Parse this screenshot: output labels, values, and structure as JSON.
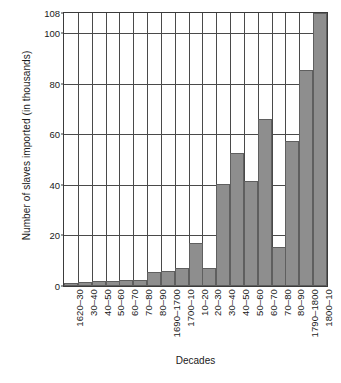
{
  "chart_data": {
    "type": "bar",
    "title": "",
    "xlabel": "Decades",
    "ylabel": "Number of slaves imported (in thousands)",
    "categories": [
      "1620–30",
      "30–40",
      "40–50",
      "50–60",
      "60–70",
      "70–80",
      "80–90",
      "1690–1700",
      "1700–10",
      "10–20",
      "20–30",
      "30–40",
      "40–50",
      "50–60",
      "60–70",
      "70–80",
      "80–90",
      "1790–1800",
      "1800–10"
    ],
    "values": [
      1,
      1.5,
      1.8,
      2,
      2.5,
      2.5,
      5.5,
      5.8,
      7,
      17,
      7,
      40.5,
      52.5,
      41.5,
      66,
      15.5,
      57.5,
      85.5,
      108
    ],
    "ylim": [
      0,
      108
    ],
    "yticks": [
      0,
      20,
      40,
      60,
      80,
      100,
      108
    ],
    "ytick_labels": [
      "0",
      "20",
      "40",
      "60",
      "80",
      "100",
      "108"
    ],
    "grid": "horizontal-and-vertical",
    "legend": "none",
    "bar_color": "#8e8e8e",
    "bar_edge_color": "#5f5f5f",
    "axis_color": "#3b3b3b"
  },
  "caption": ""
}
